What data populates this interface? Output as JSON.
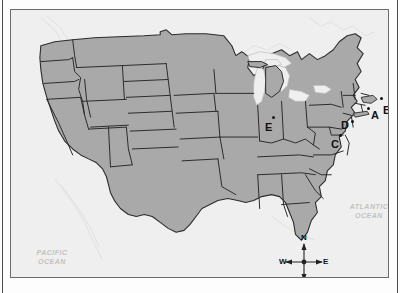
{
  "figure": {
    "kind": "map",
    "region": "Continental United States",
    "frame_border_color": "#6b6b6b",
    "land_fill": "#a9a9a9",
    "water_fill": "#efefef",
    "border_line_color": "#2b2b2b"
  },
  "ocean_labels": [
    {
      "id": "atlantic",
      "text": "ATLANTIC\nOCEAN",
      "color": "#c2c2c2"
    },
    {
      "id": "pacific",
      "text": "PACIFIC\nOCEAN",
      "color": "#c2c2c2"
    }
  ],
  "point_labels": [
    {
      "id": "a",
      "text": "A",
      "x": 360,
      "y": 100,
      "dot_x": 356,
      "dot_y": 97
    },
    {
      "id": "b",
      "text": "B",
      "x": 372,
      "y": 95,
      "dot_x": 369,
      "dot_y": 87
    },
    {
      "id": "c",
      "text": "C",
      "x": 320,
      "y": 129,
      "dot_x": 328,
      "dot_y": 124
    },
    {
      "id": "d",
      "text": "D",
      "x": 330,
      "y": 110,
      "dot_x": 340,
      "dot_y": 110
    },
    {
      "id": "e",
      "text": "E",
      "x": 254,
      "y": 112,
      "dot_x": 261,
      "dot_y": 106
    }
  ],
  "compass": {
    "name": "compass-rose",
    "north": "N",
    "south": "S",
    "east": "E",
    "west": "W"
  }
}
